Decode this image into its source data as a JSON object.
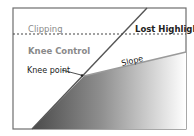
{
  "diagram": {
    "title": "Knee Control",
    "labels": {
      "clipping": "Clipping",
      "lost_highlights": "Lost Highlights",
      "knee_control": "Knee Control",
      "knee_point": "Knee point",
      "slope": "Slope"
    },
    "colors": {
      "frame": "#6e6e6e",
      "steep_line": "#555555",
      "slope_line": "#9a9a9a",
      "gradient_start": "#4a4a4a",
      "gradient_end": "#ffffff",
      "label_dark": "#222222",
      "label_grey": "#8a8a8a",
      "dashed_line": "#444444"
    }
  }
}
